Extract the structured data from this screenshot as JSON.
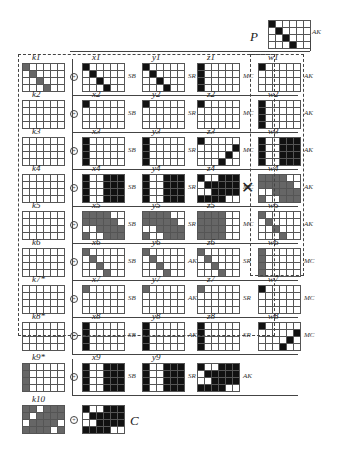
{
  "title_labels": {
    "P": "P",
    "C": "C"
  },
  "ops": {
    "SB": "SB",
    "SR": "SR",
    "MC": "MC",
    "AK": "AK"
  },
  "colors": {
    "black": "#111111",
    "gray": "#666666",
    "light_gray": "#aaaaaa"
  },
  "plaintext": {
    "label": "P",
    "op": "AK",
    "cells": "100000010000001000000100"
  },
  "rounds": [
    {
      "k": "k1",
      "x": "x1",
      "y": "y1",
      "z": "z1",
      "w": "w1",
      "kcells": "200000020000002000000200",
      "xcells": "100000010000001000000100",
      "ycells": "100000010000001000000100",
      "zcells": "100000100000100000100000",
      "wcells": "100000000000000000000000",
      "ops": [
        "SB",
        "SR",
        "MC",
        "AK"
      ]
    },
    {
      "k": "k2",
      "x": "x2",
      "y": "y2",
      "z": "z2",
      "w": "w2",
      "kcells": "000000000000000000000000",
      "xcells": "100000000000000000000000",
      "ycells": "100000000000000000000000",
      "zcells": "100000000000000000000000",
      "wcells": "100000100000100000100000",
      "ops": [
        "SB",
        "SR",
        "MC",
        "AK"
      ]
    },
    {
      "k": "k3",
      "x": "x3",
      "y": "y3",
      "z": "z3",
      "w": "w3",
      "kcells": "000000000000000000000000",
      "xcells": "100000100000100000100000",
      "ycells": "100000100000100000100000",
      "zcells": "100000000001000010000100",
      "wcells": "100111100111100111100111",
      "ops": [
        "SB",
        "SR",
        "MC",
        "AK"
      ]
    },
    {
      "k": "k4",
      "x": "x4",
      "y": "y4",
      "z": "z4",
      "w": "w4",
      "kcells": "000000000000000000000000",
      "xcells": "100111100111100111100111",
      "ycells": "100111100111100111100111",
      "zcells": "100111011111001111111100",
      "wcells": "222200222220002222200222",
      "ops": [
        "SB",
        "SR",
        "MC",
        "AK"
      ],
      "mc_crossed": true
    },
    {
      "k": "k5",
      "x": "x5",
      "y": "y5",
      "z": "z5",
      "w": "w5",
      "kcells": "000000000000000000000000",
      "xcells": "222200222220002222200222",
      "ycells": "222200222220002222200222",
      "zcells": "222200222200222200222200",
      "wcells": "200000020000002000000200",
      "ops": [
        "SB",
        "SR",
        "MC",
        "AK"
      ]
    },
    {
      "k": "k6",
      "x": "x6",
      "y": "y6",
      "z": "z6",
      "w": "w6",
      "kcells": "000000000000000000000000",
      "xcells": "200000020000002000000200",
      "ycells": "200000020000002000000200",
      "zcells": "200000020000002000000200",
      "wcells": "200000200000200000200000",
      "ops": [
        "SB",
        "AK",
        "SR",
        "MC"
      ]
    },
    {
      "k": "k7*",
      "x": "x7",
      "y": "y7",
      "z": "z7",
      "w": "w7",
      "kcells": "000000000000000000000000",
      "xcells": "200000000000000000000000",
      "ycells": "200000000000000000000000",
      "zcells": "200000000000000000000000",
      "wcells": "100000000000000000000000",
      "ops": [
        "SB",
        "AK",
        "SR",
        "MC"
      ]
    },
    {
      "k": "k8*",
      "x": "x8",
      "y": "y8",
      "z": "z8",
      "w": "w8",
      "kcells": "000000000000000000000000",
      "xcells": "100000100000100000100000",
      "ycells": "100000100000100000100000",
      "zcells": "100000100000100000100000",
      "wcells": "100000000001000010000100",
      "ops": [
        "SB",
        "AK",
        "SR",
        "MC"
      ]
    },
    {
      "k": "k9*",
      "x": "x9",
      "y": "y9",
      "z": "",
      "w": "",
      "kcells": "200000200000200000200000",
      "xcells": "100111100111100111100111",
      "ycells": "100111100111100111100111",
      "zcells": "100111011111001111111100",
      "ops": [
        "SB",
        "SR",
        "AK"
      ]
    },
    {
      "k": "k10",
      "kcells": "220222202222022220222202",
      "ccells": "100111011111001111111100",
      "clabel": "C"
    }
  ]
}
